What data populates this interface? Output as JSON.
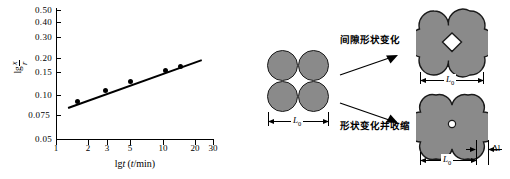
{
  "chart_data": {
    "type": "scatter",
    "title": "",
    "xlabel": "lg t (t/min)",
    "ylabel": "lg x/r",
    "xscale": "log",
    "yscale": "log",
    "xlim": [
      1,
      30
    ],
    "ylim": [
      0.05,
      0.5
    ],
    "grid": false,
    "legend": null,
    "xticks": [
      "1",
      "2",
      "3",
      "5",
      "10",
      "20",
      "30"
    ],
    "xtick_values": [
      1,
      2,
      3,
      5,
      10,
      20,
      30
    ],
    "yticks": [
      "0.50",
      "0.40",
      "0.30",
      "0.20",
      "0.15",
      "0.10",
      "0.075",
      "0.05"
    ],
    "ytick_values": [
      0.5,
      0.4,
      0.3,
      0.2,
      0.15,
      0.1,
      0.075,
      0.05
    ],
    "x": [
      1.6,
      2.9,
      5.0,
      10.5,
      14.5
    ],
    "values": [
      0.098,
      0.119,
      0.138,
      0.169,
      0.18
    ],
    "series": [
      {
        "name": "x/r vs t",
        "x": [
          1.6,
          2.9,
          5.0,
          10.5,
          14.5
        ],
        "values": [
          0.098,
          0.119,
          0.138,
          0.169,
          0.18
        ]
      }
    ],
    "fit_line": {
      "x_start": 1.3,
      "y_start": 0.089,
      "x_end": 23.0,
      "y_end": 0.205
    },
    "ylabel_numerator": "x",
    "ylabel_denominator": "r",
    "ylabel_prefix": "lg"
  },
  "diagram": {
    "initial_state": {
      "name": "four-particle-stack",
      "particle_count": 4,
      "dimension_label": "L",
      "dimension_subscript": "0"
    },
    "transitions": [
      {
        "label": "间隙形状变化",
        "target": "pore-shape-change"
      },
      {
        "label": "形状变化并收缩",
        "target": "shape-change-and-shrinkage"
      }
    ],
    "upper_state": {
      "name": "clover-with-diamond-pore",
      "dimension_label": "L",
      "dimension_subscript": "0"
    },
    "lower_state": {
      "name": "clover-with-round-pore",
      "dimension_label": "L",
      "dimension_subscript": "0",
      "shrinkage_label": "Δl"
    },
    "colors": {
      "particle_fill": "#8a8a8a",
      "particle_stroke": "#1a1a1a",
      "text": "#000000"
    }
  }
}
